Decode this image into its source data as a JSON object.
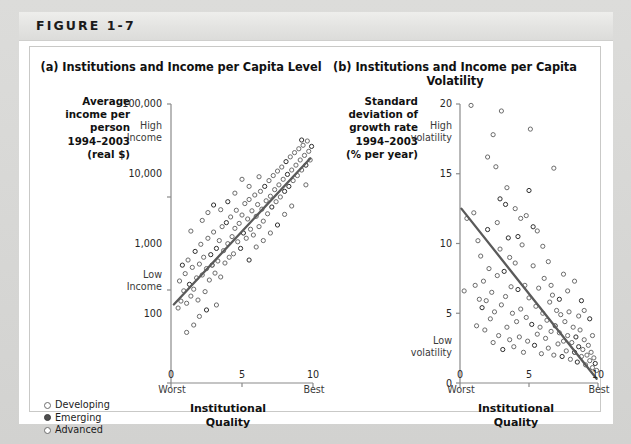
{
  "figure": {
    "header_label": "FIGURE 1-7"
  },
  "legend": {
    "items": [
      {
        "label": "Developing",
        "marker": "open-circle-icon"
      },
      {
        "label": "Emerging",
        "marker": "filled-circle-icon"
      },
      {
        "label": "Advanced",
        "marker": "open-circle-icon"
      }
    ]
  },
  "panel_a": {
    "title": "(a) Institutions and Income per Capita Level",
    "y_caption": "Average\nincome per\nperson\n1994–2003\n(real $)",
    "y_caption_lines": [
      "Average",
      "income per",
      "person",
      "1994–2003",
      "(real $)"
    ],
    "y_ticks": [
      "100,000",
      "10,000",
      "1,000",
      "100"
    ],
    "y_high_label": "High\nIncome",
    "y_high_lines": [
      "High",
      "Income"
    ],
    "y_low_lines": [
      "Low",
      "Income"
    ],
    "x_ticks": [
      "0",
      "5",
      "10"
    ],
    "x_worst": "Worst",
    "x_best": "Best",
    "x_title_lines": [
      "Institutional",
      "Quality"
    ]
  },
  "panel_b": {
    "title": "(b) Institutions and Income per Capita Volatility",
    "y_caption_lines": [
      "Standard",
      "deviation of",
      "growth rate",
      "1994–2003",
      "(% per year)"
    ],
    "y_ticks": [
      "20",
      "15",
      "10",
      "5",
      "0"
    ],
    "y_high_lines": [
      "High",
      "volatility"
    ],
    "y_low_lines": [
      "Low",
      "volatility"
    ],
    "x_ticks": [
      "0",
      "5",
      "10"
    ],
    "x_worst": "Worst",
    "x_best": "Best",
    "x_title_lines": [
      "Institutional",
      "Quality"
    ]
  },
  "chart_data": [
    {
      "type": "scatter",
      "panel": "a",
      "title": "(a) Institutions and Income per Capita Level",
      "xlabel": "Institutional Quality",
      "ylabel": "Average income per person 1994-2003 (real $)",
      "xlim": [
        0,
        10
      ],
      "ylim": [
        100,
        100000
      ],
      "yscale": "log",
      "xticks": [
        0,
        5,
        10
      ],
      "yticks": [
        100,
        1000,
        10000,
        100000
      ],
      "grid": false,
      "legend_position": "outside-bottom-left",
      "annotations": [
        "High Income",
        "Low Income",
        "Worst",
        "Best"
      ],
      "trendline": {
        "x": [
          0.2,
          9.8
        ],
        "y": [
          700,
          26000
        ]
      },
      "points": [
        [
          0.5,
          640
        ],
        [
          0.7,
          760
        ],
        [
          0.6,
          1250
        ],
        [
          0.9,
          980
        ],
        [
          1.0,
          1500
        ],
        [
          1.1,
          720
        ],
        [
          1.2,
          2100
        ],
        [
          1.3,
          1150
        ],
        [
          1.4,
          860
        ],
        [
          1.5,
          1750
        ],
        [
          1.6,
          1020
        ],
        [
          1.7,
          2600
        ],
        [
          1.8,
          1350
        ],
        [
          1.9,
          780
        ],
        [
          2.0,
          1900
        ],
        [
          2.1,
          3100
        ],
        [
          2.2,
          1450
        ],
        [
          2.3,
          2250
        ],
        [
          2.4,
          960
        ],
        [
          2.5,
          1700
        ],
        [
          2.6,
          3600
        ],
        [
          2.7,
          1280
        ],
        [
          2.8,
          2400
        ],
        [
          2.9,
          1850
        ],
        [
          3.0,
          4200
        ],
        [
          3.1,
          1520
        ],
        [
          3.2,
          2800
        ],
        [
          3.3,
          2050
        ],
        [
          3.4,
          3400
        ],
        [
          3.5,
          1380
        ],
        [
          3.6,
          4800
        ],
        [
          3.7,
          2650
        ],
        [
          3.8,
          1950
        ],
        [
          3.9,
          5300
        ],
        [
          4.0,
          3150
        ],
        [
          4.1,
          2250
        ],
        [
          4.2,
          6100
        ],
        [
          4.3,
          3750
        ],
        [
          4.4,
          2450
        ],
        [
          4.5,
          4600
        ],
        [
          4.6,
          7200
        ],
        [
          4.7,
          3300
        ],
        [
          4.8,
          5200
        ],
        [
          4.9,
          2800
        ],
        [
          5.0,
          6400
        ],
        [
          5.1,
          4100
        ],
        [
          5.2,
          8500
        ],
        [
          5.3,
          3600
        ],
        [
          5.4,
          5800
        ],
        [
          5.5,
          9400
        ],
        [
          5.6,
          4500
        ],
        [
          5.7,
          7100
        ],
        [
          5.8,
          3900
        ],
        [
          5.9,
          10500
        ],
        [
          6.0,
          6200
        ],
        [
          6.1,
          8300
        ],
        [
          6.2,
          4800
        ],
        [
          6.3,
          11500
        ],
        [
          6.4,
          7400
        ],
        [
          6.5,
          5500
        ],
        [
          6.6,
          13000
        ],
        [
          6.7,
          9100
        ],
        [
          6.8,
          6600
        ],
        [
          6.9,
          15000
        ],
        [
          7.0,
          10200
        ],
        [
          7.1,
          7800
        ],
        [
          7.2,
          17000
        ],
        [
          7.3,
          12000
        ],
        [
          7.4,
          8900
        ],
        [
          7.5,
          19000
        ],
        [
          7.6,
          13500
        ],
        [
          7.7,
          10000
        ],
        [
          7.8,
          21000
        ],
        [
          7.9,
          15500
        ],
        [
          8.0,
          11500
        ],
        [
          8.1,
          24000
        ],
        [
          8.2,
          17500
        ],
        [
          8.3,
          13000
        ],
        [
          8.4,
          27000
        ],
        [
          8.5,
          19500
        ],
        [
          8.6,
          15000
        ],
        [
          8.7,
          30000
        ],
        [
          8.8,
          22000
        ],
        [
          8.9,
          17000
        ],
        [
          9.0,
          33000
        ],
        [
          9.1,
          25000
        ],
        [
          9.2,
          19500
        ],
        [
          9.3,
          36000
        ],
        [
          9.4,
          28000
        ],
        [
          9.5,
          22000
        ],
        [
          9.6,
          40000
        ],
        [
          9.7,
          31000
        ],
        [
          9.8,
          25000
        ],
        [
          2.2,
          5600
        ],
        [
          2.6,
          6800
        ],
        [
          3.0,
          8200
        ],
        [
          1.4,
          4300
        ],
        [
          5.5,
          2100
        ],
        [
          6.0,
          2900
        ],
        [
          6.5,
          3400
        ],
        [
          7.0,
          4100
        ],
        [
          7.5,
          5000
        ],
        [
          4.0,
          8900
        ],
        [
          4.5,
          11000
        ],
        [
          3.5,
          7300
        ],
        [
          8.0,
          6500
        ],
        [
          8.5,
          8000
        ],
        [
          1.1,
          350
        ],
        [
          1.6,
          420
        ],
        [
          0.8,
          1850
        ],
        [
          2.0,
          520
        ],
        [
          2.5,
          610
        ],
        [
          3.2,
          690
        ],
        [
          5.0,
          15500
        ],
        [
          5.5,
          13000
        ],
        [
          6.2,
          16500
        ],
        [
          9.5,
          13500
        ],
        [
          9.9,
          35000
        ],
        [
          9.2,
          41000
        ]
      ]
    },
    {
      "type": "scatter",
      "panel": "b",
      "title": "(b) Institutions and Income per Capita Volatility",
      "xlabel": "Institutional Quality",
      "ylabel": "Standard deviation of growth rate 1994-2003 (% per year)",
      "xlim": [
        0,
        10
      ],
      "ylim": [
        0,
        20
      ],
      "yscale": "linear",
      "xticks": [
        0,
        5,
        10
      ],
      "yticks": [
        0,
        5,
        10,
        15,
        20
      ],
      "grid": false,
      "annotations": [
        "High volatility",
        "Low volatility",
        "Worst",
        "Best"
      ],
      "trendline": {
        "x": [
          0.1,
          9.9
        ],
        "y": [
          12.5,
          0.3
        ]
      },
      "points": [
        [
          0.3,
          6.6
        ],
        [
          0.5,
          11.8
        ],
        [
          0.8,
          19.9
        ],
        [
          1.0,
          12.2
        ],
        [
          1.2,
          4.1
        ],
        [
          1.4,
          6.0
        ],
        [
          1.5,
          9.1
        ],
        [
          1.6,
          5.4
        ],
        [
          1.7,
          7.3
        ],
        [
          1.8,
          3.8
        ],
        [
          1.9,
          5.9
        ],
        [
          2.0,
          11.0
        ],
        [
          2.1,
          8.2
        ],
        [
          2.2,
          4.6
        ],
        [
          2.3,
          6.5
        ],
        [
          2.4,
          2.9
        ],
        [
          2.5,
          5.1
        ],
        [
          2.6,
          15.5
        ],
        [
          2.7,
          7.7
        ],
        [
          2.8,
          3.4
        ],
        [
          2.9,
          9.6
        ],
        [
          3.0,
          5.6
        ],
        [
          3.1,
          2.4
        ],
        [
          3.2,
          8.0
        ],
        [
          3.3,
          6.2
        ],
        [
          3.4,
          4.0
        ],
        [
          3.5,
          10.4
        ],
        [
          3.6,
          3.1
        ],
        [
          3.7,
          6.9
        ],
        [
          3.8,
          5.0
        ],
        [
          3.9,
          2.6
        ],
        [
          4.0,
          8.6
        ],
        [
          4.1,
          4.4
        ],
        [
          4.2,
          6.7
        ],
        [
          4.3,
          3.3
        ],
        [
          4.4,
          5.3
        ],
        [
          4.5,
          9.9
        ],
        [
          4.6,
          2.2
        ],
        [
          4.7,
          7.0
        ],
        [
          4.8,
          4.7
        ],
        [
          4.9,
          3.0
        ],
        [
          5.0,
          6.1
        ],
        [
          5.1,
          18.2
        ],
        [
          5.2,
          4.2
        ],
        [
          5.3,
          8.4
        ],
        [
          5.4,
          2.7
        ],
        [
          5.5,
          5.5
        ],
        [
          5.6,
          3.5
        ],
        [
          5.7,
          6.8
        ],
        [
          5.8,
          4.0
        ],
        [
          5.9,
          2.1
        ],
        [
          6.0,
          5.0
        ],
        [
          6.1,
          7.5
        ],
        [
          6.2,
          3.2
        ],
        [
          6.3,
          4.5
        ],
        [
          6.4,
          2.5
        ],
        [
          6.5,
          5.8
        ],
        [
          6.6,
          3.7
        ],
        [
          6.7,
          6.3
        ],
        [
          6.8,
          2.0
        ],
        [
          6.9,
          4.1
        ],
        [
          7.0,
          5.2
        ],
        [
          7.1,
          2.8
        ],
        [
          7.2,
          3.6
        ],
        [
          7.3,
          4.9
        ],
        [
          7.4,
          1.9
        ],
        [
          7.5,
          3.0
        ],
        [
          7.6,
          4.4
        ],
        [
          7.7,
          2.3
        ],
        [
          7.8,
          3.4
        ],
        [
          7.9,
          5.1
        ],
        [
          8.0,
          1.7
        ],
        [
          8.1,
          2.9
        ],
        [
          8.2,
          4.0
        ],
        [
          8.3,
          2.2
        ],
        [
          8.4,
          3.3
        ],
        [
          8.5,
          1.5
        ],
        [
          8.6,
          2.6
        ],
        [
          8.7,
          3.8
        ],
        [
          8.8,
          1.9
        ],
        [
          8.9,
          2.4
        ],
        [
          9.0,
          3.1
        ],
        [
          9.1,
          1.3
        ],
        [
          9.2,
          2.0
        ],
        [
          9.3,
          2.7
        ],
        [
          9.4,
          1.6
        ],
        [
          9.5,
          2.2
        ],
        [
          9.6,
          1.1
        ],
        [
          9.7,
          1.8
        ],
        [
          9.8,
          1.4
        ],
        [
          9.9,
          0.9
        ],
        [
          2.0,
          16.2
        ],
        [
          2.4,
          17.8
        ],
        [
          3.0,
          19.5
        ],
        [
          3.4,
          14.0
        ],
        [
          2.9,
          13.2
        ],
        [
          4.0,
          12.5
        ],
        [
          5.0,
          13.8
        ],
        [
          6.8,
          15.4
        ],
        [
          8.3,
          7.3
        ],
        [
          9.0,
          5.2
        ],
        [
          9.4,
          4.6
        ],
        [
          8.8,
          5.9
        ],
        [
          1.3,
          10.2
        ],
        [
          1.1,
          7.0
        ],
        [
          4.4,
          11.8
        ],
        [
          5.6,
          10.9
        ],
        [
          6.0,
          9.8
        ],
        [
          6.4,
          8.7
        ],
        [
          3.3,
          12.8
        ],
        [
          4.8,
          12.0
        ],
        [
          7.2,
          6.0
        ],
        [
          7.8,
          6.6
        ],
        [
          8.6,
          4.8
        ],
        [
          9.6,
          3.4
        ],
        [
          2.7,
          11.5
        ],
        [
          3.6,
          9.0
        ],
        [
          4.2,
          10.5
        ],
        [
          5.3,
          11.2
        ],
        [
          6.6,
          7.0
        ],
        [
          7.5,
          7.8
        ]
      ]
    }
  ]
}
